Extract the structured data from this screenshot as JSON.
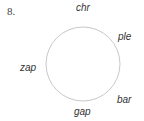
{
  "problem": {
    "number": "8."
  },
  "diagram": {
    "shape": "circle",
    "labels": {
      "top": "chr",
      "upper_right": "ple",
      "left": "zap",
      "lower_right": "bar",
      "bottom": "gap"
    },
    "stroke_color": "#c8c8c8"
  }
}
